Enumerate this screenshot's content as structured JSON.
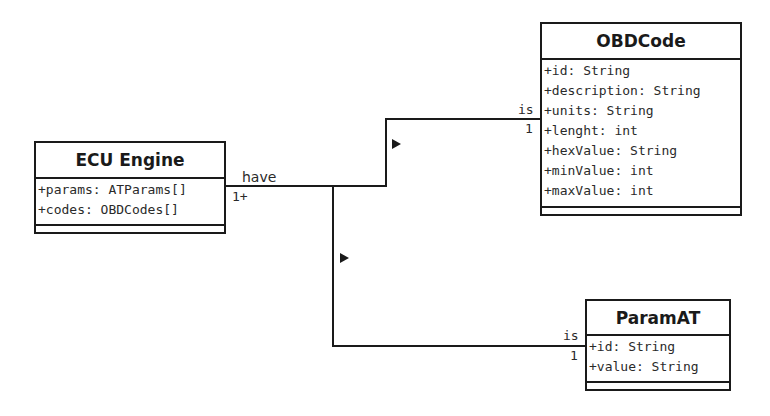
{
  "classes": {
    "ecu": {
      "name": "ECU Engine",
      "attributes": [
        "+params: ATParams[]",
        "+codes: OBDCodes[]"
      ]
    },
    "obdcode": {
      "name": "OBDCode",
      "attributes": [
        "+id: String",
        "+description: String",
        "+units: String",
        "+lenght: int",
        "+hexValue: String",
        "+minValue: int",
        "+maxValue: int"
      ]
    },
    "paramat": {
      "name": "ParamAT",
      "attributes": [
        "+id: String",
        "+value: String"
      ]
    }
  },
  "associations": {
    "have": {
      "label": "have",
      "multiplicity": "1+"
    },
    "obd_end": {
      "role": "is",
      "multiplicity": "1"
    },
    "param_end": {
      "role": "is",
      "multiplicity": "1"
    }
  },
  "colors": {
    "line": "#1a1a1a",
    "background": "#ffffff"
  }
}
